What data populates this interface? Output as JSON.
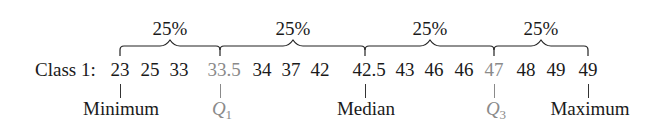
{
  "row_label": "Class 1:",
  "values": [
    {
      "text": "23",
      "highlight": false
    },
    {
      "text": "25",
      "highlight": false
    },
    {
      "text": "33",
      "highlight": false
    },
    {
      "text": "33.5",
      "highlight": true
    },
    {
      "text": "34",
      "highlight": false
    },
    {
      "text": "37",
      "highlight": false
    },
    {
      "text": "42",
      "highlight": false
    },
    {
      "text": "42.5",
      "highlight": false
    },
    {
      "text": "43",
      "highlight": false
    },
    {
      "text": "46",
      "highlight": false
    },
    {
      "text": "46",
      "highlight": false
    },
    {
      "text": "47",
      "highlight": true
    },
    {
      "text": "48",
      "highlight": false
    },
    {
      "text": "49",
      "highlight": false
    },
    {
      "text": "49",
      "highlight": false
    }
  ],
  "segments": [
    {
      "label": "25%"
    },
    {
      "label": "25%"
    },
    {
      "label": "25%"
    },
    {
      "label": "25%"
    }
  ],
  "markers": {
    "minimum": "Minimum",
    "q1": {
      "letter": "Q",
      "sub": "1"
    },
    "median": "Median",
    "q3": {
      "letter": "Q",
      "sub": "3"
    },
    "maximum": "Maximum"
  },
  "colors": {
    "text": "#1a1a1a",
    "quartile": "#8a8a8a"
  }
}
